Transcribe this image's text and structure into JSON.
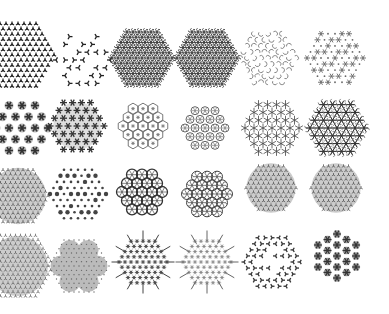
{
  "figure": {
    "layout": {
      "rows": 4,
      "cols": 6
    },
    "background": "#ffffff",
    "ink": "#333333",
    "tiles": [
      {
        "row": 0,
        "col": 0,
        "cx": 18,
        "cy": 55,
        "r": 36,
        "style": "dense-dots",
        "ink": "#222222",
        "clip": true
      },
      {
        "row": 0,
        "col": 1,
        "cx": 83,
        "cy": 60,
        "r": 30,
        "style": "sparse-motifs",
        "ink": "#222222"
      },
      {
        "row": 0,
        "col": 2,
        "cx": 142,
        "cy": 58,
        "r": 32,
        "style": "dense-pinwheel",
        "ink": "#333333"
      },
      {
        "row": 0,
        "col": 3,
        "cx": 207,
        "cy": 58,
        "r": 32,
        "style": "dense-pinwheel",
        "ink": "#333333"
      },
      {
        "row": 0,
        "col": 4,
        "cx": 268,
        "cy": 58,
        "r": 28,
        "style": "light-swirl",
        "ink": "#777777"
      },
      {
        "row": 0,
        "col": 5,
        "cx": 335,
        "cy": 58,
        "r": 28,
        "style": "stars-dots",
        "ink": "#666666"
      },
      {
        "row": 1,
        "col": 0,
        "cx": 22,
        "cy": 128,
        "r": 30,
        "style": "rosettes",
        "ink": "#333333",
        "clip": true
      },
      {
        "row": 1,
        "col": 1,
        "cx": 77,
        "cy": 126,
        "r": 28,
        "style": "star-cluster",
        "ink": "#333333"
      },
      {
        "row": 1,
        "col": 2,
        "cx": 143,
        "cy": 126,
        "r": 28,
        "style": "hex-lattice",
        "ink": "#555555"
      },
      {
        "row": 1,
        "col": 3,
        "cx": 205,
        "cy": 128,
        "r": 28,
        "style": "circles-grid",
        "ink": "#666666"
      },
      {
        "row": 1,
        "col": 4,
        "cx": 272,
        "cy": 128,
        "r": 28,
        "style": "star-lattice",
        "ink": "#444444"
      },
      {
        "row": 1,
        "col": 5,
        "cx": 337,
        "cy": 128,
        "r": 28,
        "style": "pinwheel-stars",
        "ink": "#333333"
      },
      {
        "row": 2,
        "col": 0,
        "cx": 18,
        "cy": 196,
        "r": 32,
        "style": "dense-grey",
        "ink": "#555555",
        "clip": true
      },
      {
        "row": 2,
        "col": 1,
        "cx": 78,
        "cy": 194,
        "r": 30,
        "style": "dot-grid",
        "ink": "#444444"
      },
      {
        "row": 2,
        "col": 2,
        "cx": 142,
        "cy": 192,
        "r": 28,
        "style": "flower-of-life",
        "ink": "#333333"
      },
      {
        "row": 2,
        "col": 3,
        "cx": 207,
        "cy": 194,
        "r": 30,
        "style": "flower-of-life-light",
        "ink": "#444444"
      },
      {
        "row": 2,
        "col": 4,
        "cx": 271,
        "cy": 188,
        "r": 28,
        "style": "dense-grey",
        "ink": "#555555"
      },
      {
        "row": 2,
        "col": 5,
        "cx": 336,
        "cy": 188,
        "r": 28,
        "style": "dense-grey",
        "ink": "#555555"
      },
      {
        "row": 3,
        "col": 0,
        "cx": 18,
        "cy": 266,
        "r": 34,
        "style": "dense-grey",
        "ink": "#666666",
        "clip": true
      },
      {
        "row": 3,
        "col": 1,
        "cx": 79,
        "cy": 266,
        "r": 30,
        "style": "snowflake-grey",
        "ink": "#666666"
      },
      {
        "row": 3,
        "col": 2,
        "cx": 143,
        "cy": 262,
        "r": 30,
        "style": "snowflake-spiky",
        "ink": "#444444"
      },
      {
        "row": 3,
        "col": 3,
        "cx": 207,
        "cy": 262,
        "r": 30,
        "style": "snowflake-spiky-light",
        "ink": "#666666"
      },
      {
        "row": 3,
        "col": 4,
        "cx": 272,
        "cy": 262,
        "r": 28,
        "style": "sparse-ring",
        "ink": "#333333"
      },
      {
        "row": 3,
        "col": 5,
        "cx": 337,
        "cy": 256,
        "r": 26,
        "style": "rosette-snowflake",
        "ink": "#333333"
      }
    ]
  }
}
